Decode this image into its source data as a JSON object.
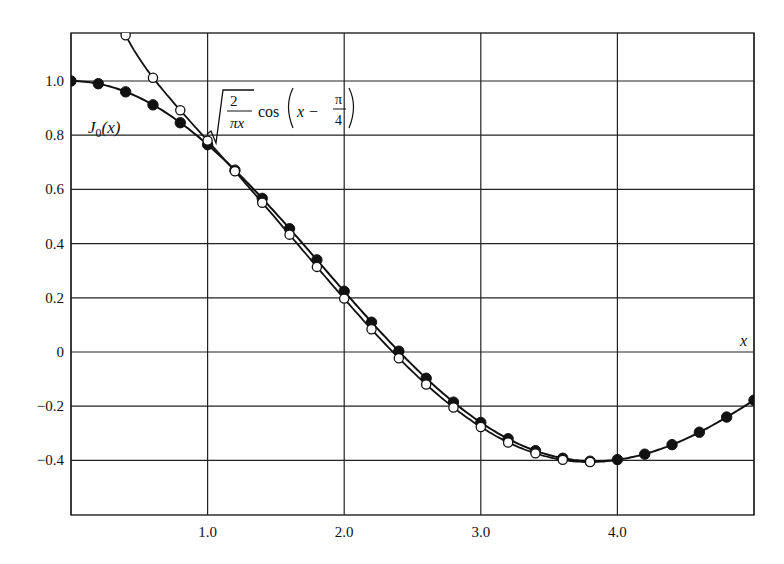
{
  "chart_data": {
    "type": "line",
    "title": "",
    "xlabel": "x",
    "ylabel": "",
    "xlim": [
      0,
      5
    ],
    "ylim": [
      -0.6,
      1.19
    ],
    "grid": true,
    "legend": "inline annotations",
    "x_ticks": [
      {
        "value": 1.0,
        "label": "1.0"
      },
      {
        "value": 2.0,
        "label": "2.0"
      },
      {
        "value": 3.0,
        "label": "3.0"
      },
      {
        "value": 4.0,
        "label": "4.0"
      }
    ],
    "x_gridlines": [
      0,
      1,
      2,
      3,
      4,
      5
    ],
    "y_ticks": [
      {
        "value": 1.0,
        "label": "1.0"
      },
      {
        "value": 0.8,
        "label": "0.8"
      },
      {
        "value": 0.6,
        "label": "0.6"
      },
      {
        "value": 0.4,
        "label": "0.4"
      },
      {
        "value": 0.2,
        "label": "0.2"
      },
      {
        "value": 0.0,
        "label": "0"
      },
      {
        "value": -0.2,
        "label": "−0.2"
      },
      {
        "value": -0.4,
        "label": "−0.4"
      }
    ],
    "series": [
      {
        "name": "J0(x)",
        "label": "J₀(x)",
        "marker": "filled-circle",
        "x": [
          0.0,
          0.2,
          0.4,
          0.6,
          0.8,
          1.0,
          1.2,
          1.4,
          1.6,
          1.8,
          2.0,
          2.2,
          2.4,
          2.6,
          2.8,
          3.0,
          3.2,
          3.4,
          3.6,
          3.8,
          4.0,
          4.2,
          4.4,
          4.6,
          4.8,
          5.0
        ],
        "values": [
          1.0,
          0.99,
          0.96,
          0.912,
          0.846,
          0.765,
          0.671,
          0.567,
          0.455,
          0.34,
          0.224,
          0.11,
          0.003,
          -0.097,
          -0.185,
          -0.26,
          -0.32,
          -0.364,
          -0.392,
          -0.403,
          -0.397,
          -0.377,
          -0.342,
          -0.296,
          -0.24,
          -0.178
        ]
      },
      {
        "name": "sqrt(2/(pi x)) cos(x - pi/4)",
        "label": "√(2/πx) cos(x − π/4)",
        "marker": "open-circle",
        "x": [
          0.4,
          0.6,
          0.8,
          1.0,
          1.2,
          1.4,
          1.6,
          1.8,
          2.0,
          2.2,
          2.4,
          2.6,
          2.8,
          3.0,
          3.2,
          3.4,
          3.6,
          3.8
        ],
        "values": [
          1.169,
          1.012,
          0.892,
          0.78,
          0.667,
          0.551,
          0.433,
          0.314,
          0.197,
          0.084,
          -0.023,
          -0.12,
          -0.205,
          -0.277,
          -0.334,
          -0.374,
          -0.398,
          -0.406
        ]
      }
    ],
    "annotations": [
      {
        "text": "J₀(x)",
        "near_x": 0.35,
        "near_y": 0.86
      },
      {
        "text": "√(2/πx) cos(x − π/4)",
        "near_x": 1.5,
        "near_y": 0.85
      },
      {
        "text": "x",
        "near_x": 4.95,
        "near_y": 0.04
      }
    ]
  },
  "labels": {
    "j0": "J",
    "j0_sub": "0",
    "j0_arg": "(x)",
    "formula_num": "2",
    "formula_den": "πx",
    "formula_cos": "cos",
    "formula_x_minus": "x −",
    "formula_pi": "π",
    "formula_four": "4",
    "x_axis": "x"
  }
}
